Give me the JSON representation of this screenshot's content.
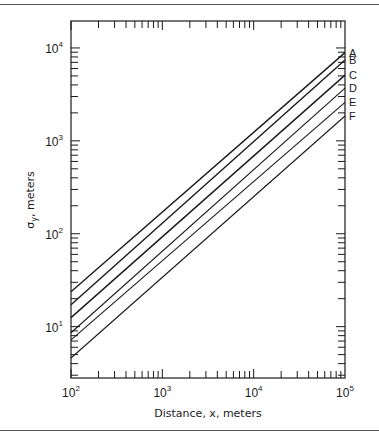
{
  "chart_data": {
    "type": "line",
    "title": "",
    "xlabel": "Distance, x, meters",
    "ylabel": "σy, meters",
    "xscale": "log",
    "yscale": "log",
    "xlim": [
      100,
      100000
    ],
    "ylim": [
      2.8,
      19500
    ],
    "grid": false,
    "x_ticks": [
      {
        "base": "10",
        "exp": "2",
        "value": 100
      },
      {
        "base": "10",
        "exp": "3",
        "value": 1000
      },
      {
        "base": "10",
        "exp": "4",
        "value": 10000
      },
      {
        "base": "10",
        "exp": "5",
        "value": 100000
      }
    ],
    "y_ticks": [
      {
        "base": "10",
        "exp": "1",
        "value": 10
      },
      {
        "base": "10",
        "exp": "2",
        "value": 100
      },
      {
        "base": "10",
        "exp": "3",
        "value": 1000
      },
      {
        "base": "10",
        "exp": "4",
        "value": 10000
      }
    ],
    "x": [
      100,
      100000
    ],
    "series": [
      {
        "name": "A",
        "values": [
          23.8,
          8900
        ]
      },
      {
        "name": "B",
        "values": [
          17.2,
          7400
        ]
      },
      {
        "name": "C",
        "values": [
          12.5,
          5100
        ]
      },
      {
        "name": "D",
        "values": [
          8.6,
          3700
        ]
      },
      {
        "name": "E",
        "values": [
          7.2,
          2600
        ]
      },
      {
        "name": "F",
        "values": [
          4.6,
          1850
        ]
      }
    ],
    "legend_position": "right edge, inline labels"
  },
  "colors": {
    "ink": "#1a1a1a",
    "rule": "#555555",
    "background": "#ffffff"
  }
}
